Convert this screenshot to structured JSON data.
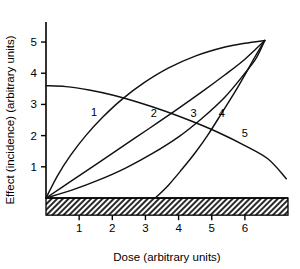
{
  "chart_data": {
    "type": "line",
    "title": "",
    "xlabel": "Dose (arbitrary units)",
    "ylabel": "Effect (incidence) (arbitrary units)",
    "xlim": [
      0,
      7.3
    ],
    "ylim": [
      0,
      5.45
    ],
    "xticks": [
      1,
      2,
      3,
      4,
      5,
      6
    ],
    "yticks": [
      1,
      2,
      3,
      4,
      5
    ],
    "grid": false,
    "legend": "inline-curve-labels",
    "background_band": {
      "name": "hatched-baseline-band",
      "label": "",
      "y_range": [
        -0.55,
        0.0
      ],
      "x_range": [
        0,
        7.3
      ],
      "pattern": "diagonal-hatch"
    },
    "convergence_point": {
      "x": 6.6,
      "y": 5.05
    },
    "series": [
      {
        "name": "1",
        "label": "1",
        "shape": "concave-down saturating",
        "label_position": {
          "x": 1.45,
          "y": 2.62
        },
        "points": [
          [
            0.0,
            0.0
          ],
          [
            0.35,
            0.72
          ],
          [
            0.75,
            1.38
          ],
          [
            1.2,
            2.0
          ],
          [
            1.7,
            2.58
          ],
          [
            2.3,
            3.17
          ],
          [
            2.95,
            3.69
          ],
          [
            3.7,
            4.17
          ],
          [
            4.5,
            4.55
          ],
          [
            5.4,
            4.84
          ],
          [
            6.0,
            4.96
          ],
          [
            6.6,
            5.05
          ]
        ]
      },
      {
        "name": "2",
        "label": "2",
        "shape": "near-linear",
        "label_position": {
          "x": 3.25,
          "y": 2.6
        },
        "points": [
          [
            0.0,
            0.0
          ],
          [
            0.7,
            0.5
          ],
          [
            1.5,
            1.07
          ],
          [
            2.3,
            1.65
          ],
          [
            3.1,
            2.22
          ],
          [
            3.9,
            2.8
          ],
          [
            4.7,
            3.4
          ],
          [
            5.4,
            3.95
          ],
          [
            6.0,
            4.45
          ],
          [
            6.6,
            5.05
          ]
        ]
      },
      {
        "name": "3",
        "label": "3",
        "shape": "concave-up",
        "label_position": {
          "x": 4.45,
          "y": 2.6
        },
        "points": [
          [
            0.0,
            0.0
          ],
          [
            0.8,
            0.26
          ],
          [
            1.6,
            0.58
          ],
          [
            2.4,
            0.96
          ],
          [
            3.2,
            1.42
          ],
          [
            4.0,
            1.96
          ],
          [
            4.7,
            2.55
          ],
          [
            5.4,
            3.24
          ],
          [
            6.0,
            4.0
          ],
          [
            6.35,
            4.5
          ],
          [
            6.6,
            5.05
          ]
        ]
      },
      {
        "name": "4",
        "label": "4",
        "shape": "threshold",
        "threshold_x": 3.3,
        "label_position": {
          "x": 5.3,
          "y": 2.6
        },
        "points": [
          [
            3.3,
            0.0
          ],
          [
            3.7,
            0.42
          ],
          [
            4.1,
            0.92
          ],
          [
            4.5,
            1.45
          ],
          [
            4.9,
            2.05
          ],
          [
            5.3,
            2.72
          ],
          [
            5.7,
            3.4
          ],
          [
            6.0,
            3.95
          ],
          [
            6.3,
            4.52
          ],
          [
            6.6,
            5.05
          ]
        ]
      },
      {
        "name": "5",
        "label": "5",
        "shape": "decreasing",
        "label_position": {
          "x": 6.0,
          "y": 1.95
        },
        "points": [
          [
            0.0,
            3.6
          ],
          [
            0.6,
            3.57
          ],
          [
            1.3,
            3.46
          ],
          [
            2.0,
            3.3
          ],
          [
            2.8,
            3.06
          ],
          [
            3.6,
            2.78
          ],
          [
            4.4,
            2.46
          ],
          [
            5.2,
            2.1
          ],
          [
            6.0,
            1.68
          ],
          [
            6.7,
            1.25
          ],
          [
            7.25,
            0.62
          ]
        ]
      }
    ]
  }
}
